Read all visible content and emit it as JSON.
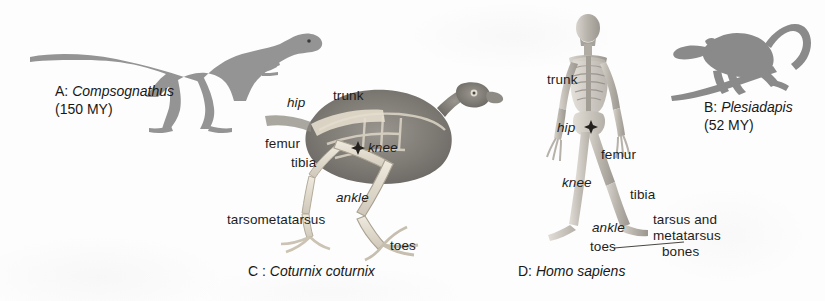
{
  "figure": {
    "background_color": "#fdfdfd",
    "ink_color": "#1e1d1c",
    "silhouette_color": "#8e8e8e",
    "panels": [
      {
        "id": "A",
        "prefix": "A:",
        "species": "Compsognathus",
        "age": "(150 MY)",
        "subject": "theropod-dinosaur-silhouette"
      },
      {
        "id": "B",
        "prefix": "B:",
        "species": "Plesiadapis",
        "age": "(52 MY)",
        "subject": "plesiadapiform-primate-silhouette-on-branch"
      },
      {
        "id": "C",
        "caption": "C : Coturnix coturnix",
        "prefix": "C :",
        "species": "Coturnix coturnix",
        "subject": "quail-skeleton-radiograph"
      },
      {
        "id": "D",
        "caption": "D: Homo sapiens",
        "prefix": "D:",
        "species": "Homo sapiens",
        "subject": "human-skeleton-radiograph"
      }
    ]
  },
  "panel_a": {
    "prefix": "A:",
    "species": "Compsognathus",
    "age": "(150 MY)"
  },
  "panel_b": {
    "prefix": "B:",
    "species": "Plesiadapis",
    "age": "(52 MY)"
  },
  "panel_c": {
    "prefix": "C :",
    "species": "Coturnix coturnix",
    "labels": {
      "hip": "hip",
      "trunk": "trunk",
      "femur": "femur",
      "knee": "knee",
      "tibia": "tibia",
      "ankle": "ankle",
      "tarsometatarsus": "tarsometatarsus",
      "toes": "toes"
    }
  },
  "panel_d": {
    "prefix": "D:",
    "species": "Homo sapiens",
    "labels": {
      "trunk": "trunk",
      "hip": "hip",
      "femur": "femur",
      "knee": "knee",
      "tibia": "tibia",
      "ankle": "ankle",
      "toes": "toes",
      "tarsus_line1": "tarsus and",
      "tarsus_line2": "metatarsus",
      "tarsus_line3": "bones"
    }
  }
}
